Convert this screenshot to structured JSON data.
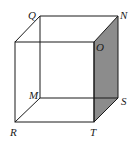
{
  "diagram": {
    "type": "cube",
    "shaded_face": [
      "O",
      "N",
      "S",
      "T"
    ],
    "shade_color": "#8c8c8c",
    "line_color": "#1a1a1a",
    "vertices": {
      "Q": {
        "label": "Q"
      },
      "N": {
        "label": "N"
      },
      "O": {
        "label": "O"
      },
      "M": {
        "label": "M"
      },
      "S": {
        "label": "S"
      },
      "R": {
        "label": "R"
      },
      "T": {
        "label": "T"
      }
    }
  }
}
